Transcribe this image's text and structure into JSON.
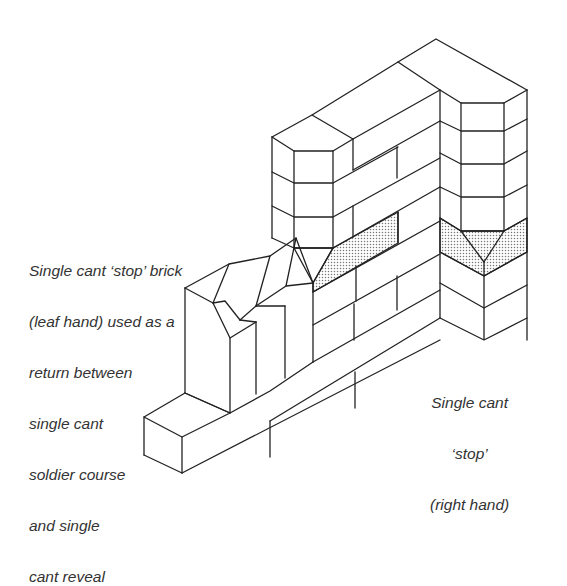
{
  "figure": {
    "line_color": "#222222",
    "shade_color": "#888888",
    "background": "#ffffff"
  },
  "labels": {
    "left_callout": {
      "lines": [
        "Single cant ‘stop’ brick",
        "(leaf hand) used as a",
        "return between",
        "single cant",
        "soldier course",
        "and single",
        "cant reveal"
      ]
    },
    "right_callout": {
      "lines": [
        "Single cant",
        "‘stop’",
        "(right hand)"
      ]
    }
  }
}
